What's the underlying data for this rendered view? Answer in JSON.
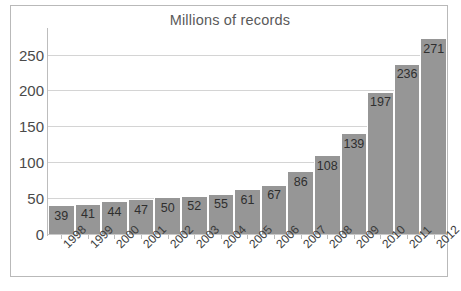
{
  "chart_data": {
    "type": "bar",
    "title": "Millions of records",
    "xlabel": "",
    "ylabel": "",
    "categories": [
      "1998",
      "1999",
      "2000",
      "2001",
      "2002",
      "2003",
      "2004",
      "2005",
      "2006",
      "2007",
      "2008",
      "2009",
      "2010",
      "2011",
      "2012"
    ],
    "values": [
      39,
      41,
      44,
      47,
      50,
      52,
      55,
      61,
      67,
      86,
      108,
      139,
      197,
      236,
      271
    ],
    "data_labels": [
      "39",
      "41",
      "44",
      "47",
      "50",
      "52",
      "55",
      "61",
      "67",
      "86",
      "108",
      "139",
      "197",
      "236",
      "271"
    ],
    "ytick_labels": [
      "250",
      "200",
      "150",
      "100",
      "50",
      "0"
    ],
    "ytick_values": [
      250,
      200,
      150,
      100,
      50,
      0
    ],
    "ylim": [
      0,
      280
    ],
    "grid": true,
    "gridlines_at": [
      250,
      200,
      150,
      100,
      50
    ],
    "legend": null,
    "legend_position": "none",
    "series": [
      {
        "name": "Millions of records",
        "values": [
          39,
          41,
          44,
          47,
          50,
          52,
          55,
          61,
          67,
          86,
          108,
          139,
          197,
          236,
          271
        ]
      }
    ]
  },
  "style": {
    "bar_color": "#969696",
    "bar_gap_color": "#ffffff",
    "gridline_color": "#d4d4d4",
    "axis_line_color": "#bdbdbd",
    "frame_border_color": "#b9b9b9",
    "title_color": "#5a5a5a",
    "tick_label_color": "#4a4a4a",
    "data_label_color": "#2f2f2f",
    "background": "#ffffff"
  }
}
